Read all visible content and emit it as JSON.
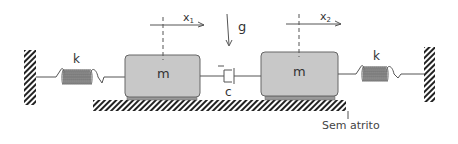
{
  "diagram": {
    "type": "two-mass spring-damper system",
    "mass_1": {
      "label": "m",
      "displacement_label": "x",
      "displacement_sub": "1"
    },
    "mass_2": {
      "label": "m",
      "displacement_label": "x",
      "displacement_sub": "2"
    },
    "spring_left": {
      "label": "k"
    },
    "spring_right": {
      "label": "k"
    },
    "damper": {
      "label": "c"
    },
    "gravity": {
      "label": "g"
    },
    "floor_note": "Sem atrito",
    "colors": {
      "mass_fill": "#c8c8c8",
      "mass_stroke": "#666666",
      "line": "#555555",
      "hatch": "#222222"
    }
  }
}
